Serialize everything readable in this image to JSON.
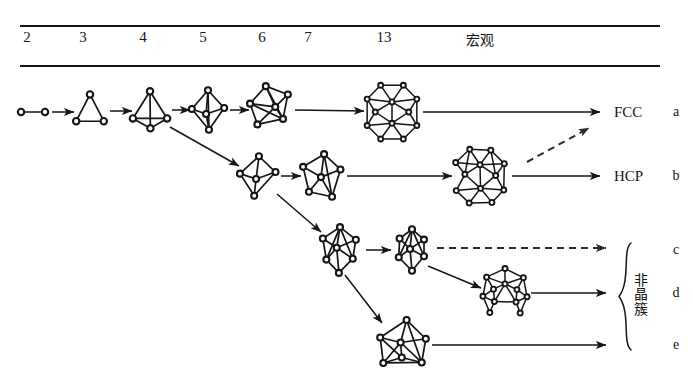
{
  "figure": {
    "type": "cluster-growth-pathway-diagram",
    "background": "#ffffff",
    "ink": "#151515",
    "width": 693,
    "height": 381
  },
  "header": {
    "columns": [
      {
        "label": "2",
        "x": 27
      },
      {
        "label": "3",
        "x": 83
      },
      {
        "label": "4",
        "x": 143
      },
      {
        "label": "5",
        "x": 203
      },
      {
        "label": "6",
        "x": 262
      },
      {
        "label": "7",
        "x": 308
      },
      {
        "label": "13",
        "x": 384
      }
    ],
    "macro_label": "宏观",
    "macro_x": 480,
    "label_y": 38,
    "rule_top_y": 26,
    "rule_bottom_y": 66,
    "rule_x0": 20,
    "rule_x1": 660
  },
  "rows": [
    {
      "letter": "a",
      "letter_x": 676,
      "y": 112,
      "endpoint": "FCC",
      "endpoint_x": 614
    },
    {
      "letter": "b",
      "letter_x": 676,
      "y": 176,
      "endpoint": "HCP",
      "endpoint_x": 614
    },
    {
      "letter": "c",
      "letter_x": 676,
      "y": 250,
      "endpoint": "",
      "endpoint_x": 614
    },
    {
      "letter": "d",
      "letter_x": 676,
      "y": 293,
      "endpoint": "",
      "endpoint_x": 614
    },
    {
      "letter": "e",
      "letter_x": 676,
      "y": 345,
      "endpoint": "",
      "endpoint_x": 614
    }
  ],
  "brace": {
    "label": "非晶簇",
    "label_chars": [
      "非",
      "晶",
      "簇"
    ],
    "label_x": 641,
    "label_y": 295,
    "x": 620,
    "y_top": 243,
    "y_bottom": 350
  },
  "clusters": [
    {
      "id": "a2",
      "row": "a",
      "atoms": 2,
      "shape": "dimer",
      "cx": 33,
      "cy": 112,
      "r": 12
    },
    {
      "id": "a3",
      "row": "a",
      "atoms": 3,
      "shape": "triangle",
      "cx": 90,
      "cy": 110,
      "r": 15
    },
    {
      "id": "a4",
      "row": "a",
      "atoms": 4,
      "shape": "tetrahedron",
      "cx": 150,
      "cy": 110,
      "r": 18
    },
    {
      "id": "a5",
      "row": "a",
      "atoms": 5,
      "shape": "trig-bipyramid",
      "cx": 208,
      "cy": 110,
      "r": 19
    },
    {
      "id": "a6",
      "row": "a",
      "atoms": 6,
      "shape": "octahedron",
      "cx": 270,
      "cy": 108,
      "r": 21
    },
    {
      "id": "a13",
      "row": "a",
      "atoms": 13,
      "shape": "cuboctahedron",
      "cx": 392,
      "cy": 112,
      "r": 27
    },
    {
      "id": "b5",
      "row": "b",
      "atoms": 5,
      "shape": "sq-pyramid",
      "cx": 258,
      "cy": 176,
      "r": 19
    },
    {
      "id": "b6",
      "row": "b",
      "atoms": 6,
      "shape": "capped-tet",
      "cx": 322,
      "cy": 176,
      "r": 21
    },
    {
      "id": "b13",
      "row": "b",
      "atoms": 13,
      "shape": "anticuboctahedron",
      "cx": 480,
      "cy": 176,
      "r": 27
    },
    {
      "id": "c6",
      "row": "c",
      "atoms": 6,
      "shape": "pentag-pyramid",
      "cx": 340,
      "cy": 250,
      "r": 22
    },
    {
      "id": "c7",
      "row": "c",
      "atoms": 7,
      "shape": "pentag-bipyramid",
      "cx": 412,
      "cy": 250,
      "r": 20
    },
    {
      "id": "d13",
      "row": "d",
      "atoms": 13,
      "shape": "icosahedron",
      "cx": 505,
      "cy": 292,
      "r": 23
    },
    {
      "id": "e7",
      "row": "e",
      "atoms": 7,
      "shape": "capped-octahedron",
      "cx": 403,
      "cy": 345,
      "r": 24
    }
  ],
  "arrows": [
    {
      "id": "ar-a2-a3",
      "style": "solid",
      "x1": 52,
      "y1": 112,
      "x2": 74,
      "y2": 112
    },
    {
      "id": "ar-a3-a4",
      "style": "solid",
      "x1": 110,
      "y1": 111,
      "x2": 132,
      "y2": 111
    },
    {
      "id": "ar-a4-a5",
      "style": "solid",
      "x1": 172,
      "y1": 110,
      "x2": 190,
      "y2": 110
    },
    {
      "id": "ar-a5-a6",
      "style": "solid",
      "x1": 230,
      "y1": 110,
      "x2": 249,
      "y2": 110
    },
    {
      "id": "ar-a6-a13",
      "style": "solid",
      "x1": 295,
      "y1": 110,
      "x2": 364,
      "y2": 111
    },
    {
      "id": "ar-a13-fcc",
      "style": "solid",
      "x1": 423,
      "y1": 112,
      "x2": 600,
      "y2": 112
    },
    {
      "id": "ar-a4-b5",
      "style": "solid",
      "x1": 170,
      "y1": 127,
      "x2": 239,
      "y2": 166
    },
    {
      "id": "ar-b5-b6",
      "style": "solid",
      "x1": 281,
      "y1": 176,
      "x2": 301,
      "y2": 176
    },
    {
      "id": "ar-b6-b13",
      "style": "solid",
      "x1": 347,
      "y1": 176,
      "x2": 452,
      "y2": 176
    },
    {
      "id": "ar-b13-hcp",
      "style": "solid",
      "x1": 512,
      "y1": 176,
      "x2": 600,
      "y2": 176
    },
    {
      "id": "ar-b13-fcc",
      "style": "dashed",
      "x1": 527,
      "y1": 162,
      "x2": 589,
      "y2": 128
    },
    {
      "id": "ar-b5-c6",
      "style": "solid",
      "x1": 277,
      "y1": 194,
      "x2": 321,
      "y2": 232
    },
    {
      "id": "ar-c6-c7",
      "style": "solid",
      "x1": 366,
      "y1": 250,
      "x2": 391,
      "y2": 250
    },
    {
      "id": "ar-c7-out",
      "style": "dashed",
      "x1": 437,
      "y1": 248,
      "x2": 606,
      "y2": 248
    },
    {
      "id": "ar-c7-d13",
      "style": "solid",
      "x1": 428,
      "y1": 266,
      "x2": 481,
      "y2": 288
    },
    {
      "id": "ar-d13-out",
      "style": "solid",
      "x1": 531,
      "y1": 293,
      "x2": 606,
      "y2": 293
    },
    {
      "id": "ar-c6-e7",
      "style": "solid",
      "x1": 345,
      "y1": 275,
      "x2": 382,
      "y2": 323
    },
    {
      "id": "ar-e7-out",
      "style": "solid",
      "x1": 432,
      "y1": 345,
      "x2": 606,
      "y2": 345
    }
  ]
}
